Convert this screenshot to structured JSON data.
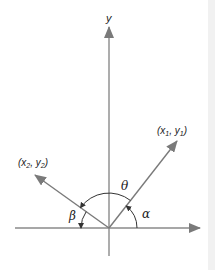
{
  "diagram": {
    "colors": {
      "axis": "#808080",
      "vector": "#808080",
      "arc": "#333333",
      "text": "#222222",
      "background": "#ffffff"
    },
    "axes": {
      "y_label": "y",
      "origin": [
        109,
        228
      ],
      "x_range_px": [
        15,
        200
      ],
      "y_range_px": [
        255,
        27
      ]
    },
    "vectors": [
      {
        "id": "v1",
        "label_x": "x",
        "label_x_sub": "1",
        "label_y": "y",
        "label_y_sub": "1",
        "tip": [
          177,
          141
        ],
        "angle_from_x_axis_label": "α"
      },
      {
        "id": "v2",
        "label_x": "x",
        "label_x_sub": "2",
        "label_y": "y",
        "label_y_sub": "2",
        "tip": [
          35,
          175
        ],
        "angle_from_neg_x_axis_label": "β"
      }
    ],
    "angles": {
      "theta": "θ",
      "alpha": "α",
      "beta": "β"
    },
    "punctuation": {
      "open": "(",
      "comma": ", ",
      "close": ")"
    }
  }
}
